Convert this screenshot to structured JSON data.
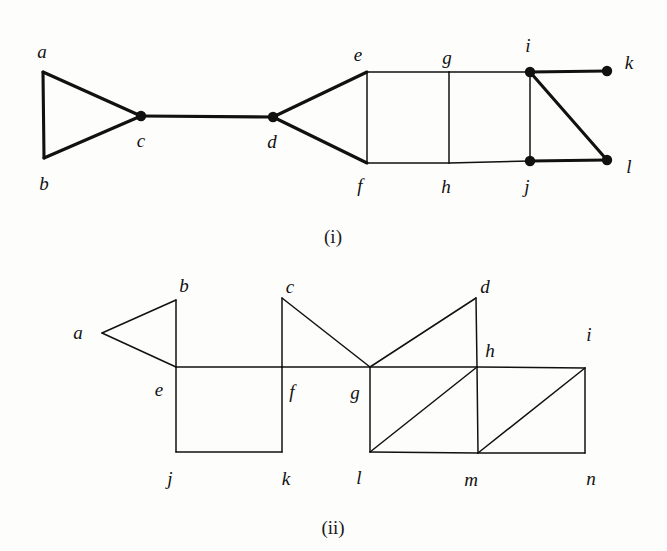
{
  "figure": {
    "background_color": "#fdfdfc",
    "ink_color": "#111111",
    "panels": [
      {
        "id": "panel-i",
        "caption": "(i)",
        "caption_pos": {
          "x": 333,
          "y": 236
        },
        "vertices": [
          {
            "name": "a",
            "x": 43,
            "y": 72,
            "filled": false,
            "label": "a",
            "label_x": 42,
            "label_y": 51
          },
          {
            "name": "b",
            "x": 44,
            "y": 158,
            "filled": false,
            "label": "b",
            "label_x": 44,
            "label_y": 183
          },
          {
            "name": "c",
            "x": 141,
            "y": 116,
            "filled": true,
            "label": "c",
            "label_x": 141,
            "label_y": 140
          },
          {
            "name": "d",
            "x": 273,
            "y": 117,
            "filled": true,
            "label": "d",
            "label_x": 272,
            "label_y": 141
          },
          {
            "name": "e",
            "x": 367,
            "y": 72,
            "filled": false,
            "label": "e",
            "label_x": 358,
            "label_y": 54
          },
          {
            "name": "f",
            "x": 367,
            "y": 163,
            "filled": false,
            "label": "f",
            "label_x": 360,
            "label_y": 185
          },
          {
            "name": "g",
            "x": 449,
            "y": 72,
            "filled": false,
            "label": "g",
            "label_x": 447,
            "label_y": 57
          },
          {
            "name": "h",
            "x": 449,
            "y": 163,
            "filled": false,
            "label": "h",
            "label_x": 446,
            "label_y": 186
          },
          {
            "name": "i",
            "x": 530,
            "y": 72,
            "filled": true,
            "label": "i",
            "label_x": 528,
            "label_y": 45
          },
          {
            "name": "j",
            "x": 530,
            "y": 161,
            "filled": true,
            "label": "j",
            "label_x": 527,
            "label_y": 186
          },
          {
            "name": "k",
            "x": 607,
            "y": 71,
            "filled": true,
            "label": "k",
            "label_x": 629,
            "label_y": 62
          },
          {
            "name": "l",
            "x": 607,
            "y": 160,
            "filled": true,
            "label": "l",
            "label_x": 629,
            "label_y": 166
          }
        ],
        "edges": [
          {
            "from": "a",
            "to": "b",
            "weight": "thick"
          },
          {
            "from": "a",
            "to": "c",
            "weight": "thick"
          },
          {
            "from": "b",
            "to": "c",
            "weight": "thick"
          },
          {
            "from": "c",
            "to": "d",
            "weight": "thick"
          },
          {
            "from": "d",
            "to": "e",
            "weight": "thick"
          },
          {
            "from": "d",
            "to": "f",
            "weight": "thick"
          },
          {
            "from": "e",
            "to": "f",
            "weight": "thin"
          },
          {
            "from": "e",
            "to": "g",
            "weight": "thin"
          },
          {
            "from": "f",
            "to": "h",
            "weight": "thin"
          },
          {
            "from": "g",
            "to": "h",
            "weight": "thin"
          },
          {
            "from": "g",
            "to": "i",
            "weight": "thin"
          },
          {
            "from": "h",
            "to": "j",
            "weight": "thin"
          },
          {
            "from": "i",
            "to": "j",
            "weight": "thin"
          },
          {
            "from": "i",
            "to": "k",
            "weight": "thick"
          },
          {
            "from": "i",
            "to": "l",
            "weight": "thick"
          },
          {
            "from": "j",
            "to": "l",
            "weight": "thick"
          }
        ]
      },
      {
        "id": "panel-ii",
        "caption": "(ii)",
        "caption_pos": {
          "x": 333,
          "y": 527
        },
        "vertices": [
          {
            "name": "a",
            "x": 102,
            "y": 333,
            "filled": false,
            "label": "a",
            "label_x": 78,
            "label_y": 332
          },
          {
            "name": "b",
            "x": 176,
            "y": 300,
            "filled": false,
            "label": "b",
            "label_x": 184,
            "label_y": 285
          },
          {
            "name": "c",
            "x": 282,
            "y": 298,
            "filled": false,
            "label": "c",
            "label_x": 290,
            "label_y": 286
          },
          {
            "name": "d",
            "x": 476,
            "y": 298,
            "filled": false,
            "label": "d",
            "label_x": 485,
            "label_y": 286
          },
          {
            "name": "e",
            "x": 176,
            "y": 367,
            "filled": false,
            "label": "e",
            "label_x": 159,
            "label_y": 389
          },
          {
            "name": "f",
            "x": 282,
            "y": 367,
            "filled": false,
            "label": "f",
            "label_x": 292,
            "label_y": 391
          },
          {
            "name": "g",
            "x": 370,
            "y": 367,
            "filled": false,
            "label": "g",
            "label_x": 355,
            "label_y": 392
          },
          {
            "name": "h",
            "x": 477,
            "y": 367,
            "filled": false,
            "label": "h",
            "label_x": 490,
            "label_y": 350
          },
          {
            "name": "i",
            "x": 585,
            "y": 368,
            "filled": false,
            "label": "i",
            "label_x": 589,
            "label_y": 334
          },
          {
            "name": "j",
            "x": 176,
            "y": 452,
            "filled": false,
            "label": "j",
            "label_x": 170,
            "label_y": 478
          },
          {
            "name": "k",
            "x": 282,
            "y": 452,
            "filled": false,
            "label": "k",
            "label_x": 286,
            "label_y": 478
          },
          {
            "name": "l",
            "x": 370,
            "y": 452,
            "filled": false,
            "label": "l",
            "label_x": 359,
            "label_y": 477
          },
          {
            "name": "m",
            "x": 478,
            "y": 453,
            "filled": false,
            "label": "m",
            "label_x": 471,
            "label_y": 479
          },
          {
            "name": "n",
            "x": 585,
            "y": 453,
            "filled": false,
            "label": "n",
            "label_x": 591,
            "label_y": 478
          }
        ],
        "edges": [
          {
            "from": "a",
            "to": "b",
            "weight": "thin"
          },
          {
            "from": "a",
            "to": "e",
            "weight": "thin"
          },
          {
            "from": "b",
            "to": "e",
            "weight": "thin"
          },
          {
            "from": "c",
            "to": "f",
            "weight": "thin"
          },
          {
            "from": "c",
            "to": "g",
            "weight": "thin"
          },
          {
            "from": "d",
            "to": "g",
            "weight": "thin"
          },
          {
            "from": "d",
            "to": "h",
            "weight": "thin"
          },
          {
            "from": "e",
            "to": "f",
            "weight": "thin"
          },
          {
            "from": "f",
            "to": "g",
            "weight": "thin"
          },
          {
            "from": "g",
            "to": "h",
            "weight": "thin"
          },
          {
            "from": "h",
            "to": "i",
            "weight": "thin"
          },
          {
            "from": "e",
            "to": "j",
            "weight": "thin"
          },
          {
            "from": "f",
            "to": "k",
            "weight": "thin"
          },
          {
            "from": "g",
            "to": "l",
            "weight": "thin"
          },
          {
            "from": "h",
            "to": "m",
            "weight": "thin"
          },
          {
            "from": "i",
            "to": "n",
            "weight": "thin"
          },
          {
            "from": "j",
            "to": "k",
            "weight": "thin"
          },
          {
            "from": "l",
            "to": "m",
            "weight": "thin"
          },
          {
            "from": "m",
            "to": "n",
            "weight": "thin"
          },
          {
            "from": "l",
            "to": "h",
            "weight": "thin"
          },
          {
            "from": "m",
            "to": "i",
            "weight": "thin"
          }
        ]
      }
    ]
  }
}
